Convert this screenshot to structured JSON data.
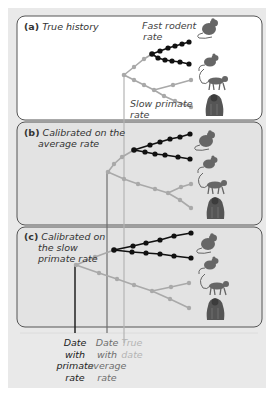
{
  "panels": [
    {
      "letter": "(a)",
      "title_lines": [
        "True history"
      ],
      "annotations": {
        "fast": [
          "Fast rodent",
          "rate"
        ],
        "slow": [
          "Slow primate",
          "rate"
        ]
      }
    },
    {
      "letter": "(b)",
      "title_lines": [
        "Calibrated on the",
        "average rate"
      ]
    },
    {
      "letter": "(c)",
      "title_lines": [
        "Calibrated on",
        "the slow",
        "primate rate"
      ]
    }
  ],
  "date_labels": [
    {
      "lines": [
        "Date",
        "with",
        "primate",
        "rate"
      ],
      "color": "#222222"
    },
    {
      "lines": [
        "Date",
        "with",
        "average",
        "rate"
      ],
      "color": "#6e6e6e"
    },
    {
      "lines": [
        "True",
        "date"
      ],
      "color": "#b4b4b4"
    }
  ],
  "animals": [
    "rat",
    "mouse",
    "monkey",
    "gorilla"
  ],
  "colors": {
    "rodent_lineage": "#111111",
    "primate_lineage": "#a9a9a9",
    "panel_a_bg": "#ffffff",
    "panel_bc_bg": "#e3e3e3",
    "frame_bg": "#e9e9e9",
    "line_primate_date": "#222222",
    "line_average_date": "#6e6e6e",
    "line_true_date": "#b4b4b4"
  }
}
